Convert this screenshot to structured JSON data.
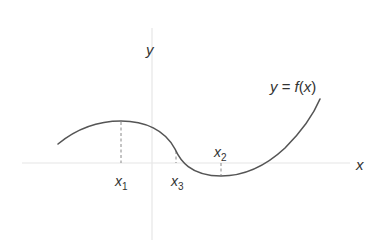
{
  "diagram": {
    "type": "function-graph",
    "axes": {
      "x_label": "x",
      "y_label": "y"
    },
    "curve": {
      "label": "y = f(x)",
      "color": "#555555",
      "features": [
        {
          "name": "local maximum",
          "at": "x1"
        },
        {
          "name": "inflection point",
          "at": "x3"
        },
        {
          "name": "local minimum",
          "at": "x2"
        }
      ]
    },
    "markers": [
      {
        "id": "x1",
        "base": "x",
        "sub": "1",
        "position": "below"
      },
      {
        "id": "x3",
        "base": "x",
        "sub": "3",
        "position": "below"
      },
      {
        "id": "x2",
        "base": "x",
        "sub": "2",
        "position": "above"
      }
    ],
    "colors": {
      "axis": "#e4e4e4",
      "curve": "#555555",
      "dashed": "#888888",
      "text": "#333333"
    }
  }
}
